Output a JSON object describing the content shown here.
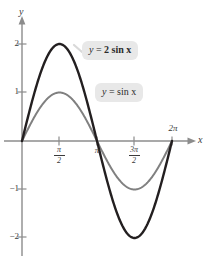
{
  "figure": {
    "background_color": "#ffffff",
    "axes": {
      "x_label": "x",
      "y_label": "y",
      "x_ticks": [
        {
          "label_main": "",
          "label_numer": "π",
          "label_denom": "2",
          "value": 1.5708
        },
        {
          "label_main": "π",
          "value": 3.1416
        },
        {
          "label_main": "",
          "label_numer": "3π",
          "label_denom": "2",
          "value": 4.7124
        },
        {
          "label_main": "2π",
          "value": 6.2832
        }
      ],
      "y_ticks": [
        {
          "label": "2",
          "value": 2
        },
        {
          "label": "1",
          "value": 1
        },
        {
          "label": "−1",
          "value": -1
        },
        {
          "label": "−2",
          "value": -2
        }
      ],
      "x_range": [
        -0.35,
        7.35
      ],
      "y_range": [
        -2.55,
        2.65
      ],
      "axis_color": "#8c8c8c"
    },
    "callouts": [
      {
        "id": "two-sin",
        "equation_lhs": "y",
        "equation_eq": "=",
        "equation_rhs": "2 sin x",
        "full_text": "y = 2 sin x",
        "background_color": "#e8e8e8",
        "has_leader_line": true
      },
      {
        "id": "sin",
        "equation_lhs": "y",
        "equation_eq": "=",
        "equation_rhs": "sin x",
        "full_text": "y = sin x",
        "background_color": "#e8e8e8",
        "has_leader_line": false
      }
    ]
  },
  "chart_data": {
    "type": "line",
    "title": "",
    "xlabel": "x",
    "ylabel": "y",
    "xlim": [
      -0.35,
      7.35
    ],
    "ylim": [
      -2.55,
      2.65
    ],
    "grid": false,
    "legend": "inline-callout-labels",
    "xticks": [
      1.5708,
      3.1416,
      4.7124,
      6.2832
    ],
    "xticklabels": [
      "π/2",
      "π",
      "3π/2",
      "2π"
    ],
    "yticks": [
      -2,
      -1,
      1,
      2
    ],
    "yticklabels": [
      "−2",
      "−1",
      "1",
      "2"
    ],
    "series": [
      {
        "name": "y = 2 sin x",
        "color": "#231f20",
        "line_width": 2.4,
        "amplitude": 2,
        "period": 6.2832,
        "formula": "2*sin(x)",
        "x": [
          0,
          0.3927,
          0.7854,
          1.1781,
          1.5708,
          1.9635,
          2.3562,
          2.7489,
          3.1416,
          3.5343,
          3.927,
          4.3197,
          4.7124,
          5.1051,
          5.4978,
          5.8905,
          6.2832
        ],
        "y": [
          0,
          0.7654,
          1.4142,
          1.8478,
          2,
          1.8478,
          1.4142,
          0.7654,
          0,
          -0.7654,
          -1.4142,
          -1.8478,
          -2,
          -1.8478,
          -1.4142,
          -0.7654,
          0
        ],
        "max": 2,
        "min": -2
      },
      {
        "name": "y = sin x",
        "color": "#808080",
        "line_width": 2.0,
        "amplitude": 1,
        "period": 6.2832,
        "formula": "sin(x)",
        "x": [
          0,
          0.3927,
          0.7854,
          1.1781,
          1.5708,
          1.9635,
          2.3562,
          2.7489,
          3.1416,
          3.5343,
          3.927,
          4.3197,
          4.7124,
          5.1051,
          5.4978,
          5.8905,
          6.2832
        ],
        "y": [
          0,
          0.3827,
          0.7071,
          0.9239,
          1,
          0.9239,
          0.7071,
          0.3827,
          0,
          -0.3827,
          -0.7071,
          -0.9239,
          -1,
          -0.9239,
          -0.7071,
          -0.3827,
          0
        ],
        "max": 1,
        "min": -1
      }
    ],
    "annotations": [
      {
        "text": "y = 2 sin x",
        "target_series": "y = 2 sin x"
      },
      {
        "text": "y = sin x",
        "target_series": "y = sin x"
      }
    ]
  }
}
